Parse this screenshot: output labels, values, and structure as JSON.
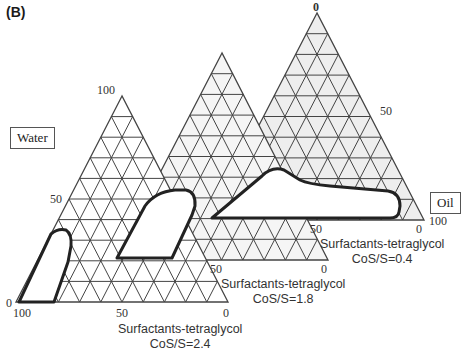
{
  "panel_label": "(B)",
  "axis_labels": {
    "water": "Water",
    "oil": "Oil"
  },
  "diagrams": [
    {
      "id": "cos-s-0.4",
      "surfactant_label": "Surfactants-tetraglycol",
      "ratio_label": "CoS/S=0.4",
      "ticks": {
        "apex": "0",
        "right_mid": "50",
        "bottom_mid": "50",
        "bottom_right": "0",
        "right_bottom": "100"
      }
    },
    {
      "id": "cos-s-1.8",
      "surfactant_label": "Surfactants-tetraglycol",
      "ratio_label": "CoS/S=1.8",
      "ticks": {
        "bottom_mid": "50",
        "bottom_right": "0"
      }
    },
    {
      "id": "cos-s-2.4",
      "surfactant_label": "Surfactants-tetraglycol",
      "ratio_label": "CoS/S=2.4",
      "ticks": {
        "apex": "100",
        "left_mid": "50",
        "left_bottom": "0",
        "bottom_left": "100",
        "bottom_mid": "50",
        "bottom_right": "0"
      }
    }
  ],
  "colors": {
    "grid": "#444444",
    "fill_back": "#eeeeee",
    "fill_mid": "#f5f5f5",
    "fill_front": "#ffffff",
    "region_outline": "#222222"
  }
}
